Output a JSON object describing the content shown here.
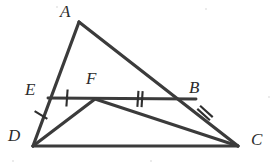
{
  "figure": {
    "background_color": "#ffffff",
    "stroke_color": "#3b3b3b",
    "label_color": "#2b2b2b",
    "width": 280,
    "height": 168
  },
  "points": {
    "A": {
      "label": "A",
      "x": 79,
      "y": 22,
      "label_x": 60,
      "label_y": 3
    },
    "B": {
      "label": "B",
      "x": 196,
      "y": 99,
      "label_x": 189,
      "label_y": 79
    },
    "C": {
      "label": "C",
      "x": 238,
      "y": 146,
      "label_x": 251,
      "label_y": 131
    },
    "D": {
      "label": "D",
      "x": 33,
      "y": 146,
      "label_x": 8,
      "label_y": 127
    },
    "E": {
      "label": "E",
      "x": 48,
      "y": 98,
      "label_x": 25,
      "label_y": 81
    },
    "F": {
      "label": "F",
      "x": 95,
      "y": 99,
      "label_x": 86,
      "label_y": 70
    }
  },
  "segments": [
    {
      "name": "segment-AD",
      "from": "A",
      "to": "D"
    },
    {
      "name": "segment-AC",
      "from": "A",
      "to": "C"
    },
    {
      "name": "segment-DC",
      "from": "D",
      "to": "C"
    },
    {
      "name": "segment-EB",
      "from": "E",
      "to": "B"
    },
    {
      "name": "segment-DF",
      "from": "D",
      "to": "F"
    },
    {
      "name": "segment-FC",
      "from": "F",
      "to": "C"
    }
  ],
  "tick_marks": [
    {
      "name": "tick-DE",
      "on": "segment-DE",
      "count": 1,
      "cx": 41,
      "cy": 115,
      "angle": -58,
      "len": 15
    },
    {
      "name": "tick-EF",
      "on": "segment-EF",
      "count": 1,
      "cx": 67,
      "cy": 98,
      "angle": 4,
      "len": 17
    },
    {
      "name": "tick-FB",
      "on": "segment-FB",
      "count": 2,
      "cx": 140,
      "cy": 99,
      "angle": 4,
      "len": 16
    },
    {
      "name": "tick-BC",
      "on": "segment-BC",
      "count": 2,
      "cx": 205,
      "cy": 113,
      "angle": -48,
      "len": 17
    }
  ],
  "noise_specks": [
    {
      "x": 12,
      "y": 160,
      "r": 1
    },
    {
      "x": 205,
      "y": 8,
      "r": 1
    },
    {
      "x": 268,
      "y": 96,
      "r": 1
    },
    {
      "x": 56,
      "y": 6,
      "r": 1
    },
    {
      "x": 150,
      "y": 160,
      "r": 1
    }
  ]
}
